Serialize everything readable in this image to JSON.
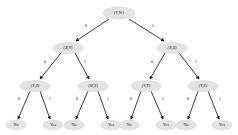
{
  "diagram": {
    "type": "binary-decision-tree",
    "node_fill_color": "#e3e3e3",
    "edge_color": "#1a1a1a",
    "background_color": "#ffffff",
    "levels": [
      {
        "level": 0,
        "nodes": [
          {
            "id": "n0",
            "label": "(V,W)",
            "cx": 119,
            "cy": 13,
            "rx": 16,
            "ry": 6
          }
        ]
      },
      {
        "level": 1,
        "nodes": [
          {
            "id": "n1",
            "label": "(X,Y)",
            "cx": 68,
            "cy": 48,
            "rx": 15,
            "ry": 5.6
          },
          {
            "id": "n2",
            "label": "(X,Z)",
            "cx": 172,
            "cy": 48,
            "rx": 15,
            "ry": 5.6
          }
        ]
      },
      {
        "level": 2,
        "nodes": [
          {
            "id": "n3",
            "label": "(V,Z)",
            "cx": 35,
            "cy": 86,
            "rx": 15,
            "ry": 5.6
          },
          {
            "id": "n4",
            "label": "(W,Z)",
            "cx": 93,
            "cy": 86,
            "rx": 15,
            "ry": 5.6
          },
          {
            "id": "n5",
            "label": "(V,Y)",
            "cx": 146,
            "cy": 86,
            "rx": 15,
            "ry": 5.6
          },
          {
            "id": "n6",
            "label": "(Y,Z)",
            "cx": 203,
            "cy": 86,
            "rx": 15,
            "ry": 5.6
          }
        ]
      },
      {
        "level": 3,
        "nodes": [
          {
            "id": "l0",
            "label": "No",
            "cx": 16,
            "cy": 125,
            "rx": 10,
            "ry": 5
          },
          {
            "id": "l1",
            "label": "Yes",
            "cx": 53,
            "cy": 125,
            "rx": 10,
            "ry": 5
          },
          {
            "id": "l2",
            "label": "No",
            "cx": 74,
            "cy": 125,
            "rx": 10,
            "ry": 5
          },
          {
            "id": "l3",
            "label": "Yes",
            "cx": 111,
            "cy": 125,
            "rx": 10,
            "ry": 5
          },
          {
            "id": "l4",
            "label": "No",
            "cx": 129,
            "cy": 125,
            "rx": 10,
            "ry": 5
          },
          {
            "id": "l5",
            "label": "Yes",
            "cx": 166,
            "cy": 125,
            "rx": 10,
            "ry": 5
          },
          {
            "id": "l6",
            "label": "No",
            "cx": 186,
            "cy": 125,
            "rx": 10,
            "ry": 5
          },
          {
            "id": "l7",
            "label": "Yes",
            "cx": 222,
            "cy": 125,
            "rx": 10,
            "ry": 5
          }
        ]
      }
    ],
    "edges": [
      {
        "from": "n0",
        "to": "n1",
        "label": "0",
        "x1": 109,
        "y1": 19,
        "x2": 76,
        "y2": 41,
        "lx": 86,
        "ly": 26
      },
      {
        "from": "n0",
        "to": "n2",
        "label": "1",
        "x1": 129,
        "y1": 19,
        "x2": 164,
        "y2": 41,
        "lx": 153,
        "ly": 26
      },
      {
        "from": "n1",
        "to": "n3",
        "label": "0",
        "x1": 61,
        "y1": 53,
        "x2": 40,
        "y2": 79,
        "lx": 45,
        "ly": 62
      },
      {
        "from": "n1",
        "to": "n4",
        "label": "1",
        "x1": 75,
        "y1": 53,
        "x2": 89,
        "y2": 79,
        "lx": 85,
        "ly": 62
      },
      {
        "from": "n2",
        "to": "n5",
        "label": "0",
        "x1": 165,
        "y1": 53,
        "x2": 150,
        "y2": 79,
        "lx": 152,
        "ly": 62
      },
      {
        "from": "n2",
        "to": "n6",
        "label": "1",
        "x1": 179,
        "y1": 53,
        "x2": 199,
        "y2": 79,
        "lx": 196,
        "ly": 62
      },
      {
        "from": "n3",
        "to": "l0",
        "label": "0",
        "x1": 30,
        "y1": 91,
        "x2": 18,
        "y2": 119,
        "lx": 19,
        "ly": 99
      },
      {
        "from": "n3",
        "to": "l1",
        "label": "1",
        "x1": 40,
        "y1": 91,
        "x2": 50,
        "y2": 119,
        "lx": 50,
        "ly": 99
      },
      {
        "from": "n4",
        "to": "l2",
        "label": "0",
        "x1": 88,
        "y1": 91,
        "x2": 76,
        "y2": 119,
        "lx": 77,
        "ly": 99
      },
      {
        "from": "n4",
        "to": "l3",
        "label": "1",
        "x1": 98,
        "y1": 91,
        "x2": 108,
        "y2": 119,
        "lx": 108,
        "ly": 99
      },
      {
        "from": "n5",
        "to": "l4",
        "label": "0",
        "x1": 141,
        "y1": 91,
        "x2": 131,
        "y2": 119,
        "lx": 131,
        "ly": 99
      },
      {
        "from": "n5",
        "to": "l5",
        "label": "1",
        "x1": 151,
        "y1": 91,
        "x2": 163,
        "y2": 119,
        "lx": 163,
        "ly": 99
      },
      {
        "from": "n6",
        "to": "l6",
        "label": "0",
        "x1": 198,
        "y1": 91,
        "x2": 188,
        "y2": 119,
        "lx": 188,
        "ly": 99
      },
      {
        "from": "n6",
        "to": "l7",
        "label": "1",
        "x1": 208,
        "y1": 91,
        "x2": 219,
        "y2": 119,
        "lx": 220,
        "ly": 99
      }
    ]
  }
}
